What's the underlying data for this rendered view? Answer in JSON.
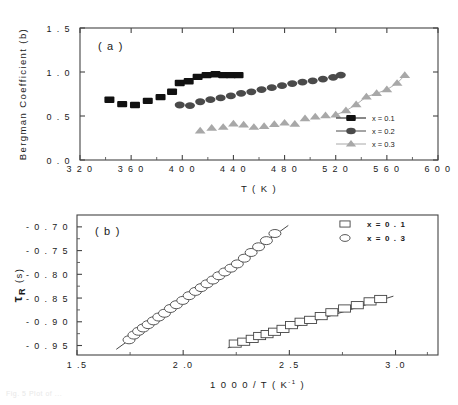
{
  "figure": {
    "caption_partial": "Fig. 5  Plot of ..."
  },
  "chart_data": [
    {
      "type": "scatter",
      "panel_label": "( a )",
      "title": "",
      "xlabel": "T ( K )",
      "ylabel": "Bergman Coefficient (b)",
      "xlim": [
        320,
        600
      ],
      "ylim": [
        0.0,
        1.5
      ],
      "xticks": [
        320,
        360,
        400,
        440,
        480,
        520,
        560,
        600
      ],
      "xticklabels": [
        "3 2 0",
        "3 6 0",
        "4 0 0",
        "4 4 0",
        "4 8 0",
        "5 2 0",
        "5 6 0",
        "6 0 0"
      ],
      "yticks": [
        0.0,
        0.5,
        1.0,
        1.5
      ],
      "yticklabels": [
        "0 . 0",
        "0 . 5",
        "1 . 0",
        "1 . 5"
      ],
      "grid": false,
      "legend_position": "lower-right",
      "series": [
        {
          "name": "x = 0.1",
          "marker": "square",
          "color": "#111111",
          "x": [
            343,
            353,
            363,
            373,
            383,
            392,
            398,
            405,
            412,
            419,
            426,
            432,
            438,
            444
          ],
          "y": [
            0.685,
            0.635,
            0.625,
            0.672,
            0.715,
            0.775,
            0.875,
            0.895,
            0.945,
            0.965,
            0.975,
            0.965,
            0.965,
            0.965
          ]
        },
        {
          "name": "x = 0.2",
          "marker": "circle",
          "color": "#4a4a4a",
          "x": [
            398,
            406,
            414,
            422,
            430,
            438,
            446,
            454,
            462,
            470,
            478,
            486,
            494,
            502,
            510,
            518,
            524
          ],
          "y": [
            0.625,
            0.618,
            0.662,
            0.685,
            0.705,
            0.728,
            0.758,
            0.775,
            0.8,
            0.822,
            0.845,
            0.868,
            0.885,
            0.9,
            0.92,
            0.94,
            0.965
          ]
        },
        {
          "name": "x = 0.3",
          "marker": "triangle",
          "color": "#a8a8a8",
          "x": [
            414,
            423,
            432,
            440,
            448,
            456,
            464,
            472,
            480,
            488,
            496,
            504,
            512,
            520,
            528,
            536,
            544,
            552,
            560,
            568,
            574
          ],
          "y": [
            0.33,
            0.362,
            0.372,
            0.41,
            0.4,
            0.372,
            0.382,
            0.405,
            0.42,
            0.408,
            0.47,
            0.49,
            0.505,
            0.512,
            0.56,
            0.63,
            0.718,
            0.758,
            0.8,
            0.872,
            0.962
          ]
        }
      ]
    },
    {
      "type": "scatter",
      "panel_label": "( b )",
      "title": "",
      "xlabel": "1 0 0 0 / T ( K⁻¹ )",
      "xlabel_main": "1 0 0 0 / T ( K",
      "xlabel_sup": "-1",
      "xlabel_tail": ")",
      "ylabel": "τR (s)",
      "ylabel_tau": "τ",
      "ylabel_sub": "R",
      "ylabel_unit": " (s)",
      "xlim": [
        1.5,
        3.2
      ],
      "ylim": [
        -0.97,
        -0.675
      ],
      "xticks": [
        1.5,
        2.0,
        2.5,
        3.0
      ],
      "xticklabels": [
        "1 .5",
        "2 .0",
        "2 .5",
        "3 .0"
      ],
      "yticks": [
        -0.7,
        -0.75,
        -0.8,
        -0.85,
        -0.9,
        -0.95
      ],
      "yticklabels": [
        "- 0 . 7 0",
        "- 0 . 7 5",
        "- 0 . 8 0",
        "- 0 . 8 5",
        "- 0 . 9 0",
        "- 0 . 9 5"
      ],
      "grid": false,
      "legend_position": "upper-right",
      "series": [
        {
          "name": "x = 0 . 1",
          "marker": "open-square",
          "color": "#444444",
          "fit_line": {
            "x": [
              2.21,
              2.99
            ],
            "y": [
              -0.955,
              -0.846
            ]
          },
          "x": [
            2.245,
            2.285,
            2.325,
            2.36,
            2.395,
            2.43,
            2.47,
            2.51,
            2.555,
            2.6,
            2.65,
            2.7,
            2.76,
            2.82,
            2.88,
            2.93
          ],
          "y": [
            -0.946,
            -0.942,
            -0.936,
            -0.93,
            -0.926,
            -0.921,
            -0.915,
            -0.907,
            -0.9,
            -0.896,
            -0.888,
            -0.88,
            -0.872,
            -0.865,
            -0.857,
            -0.852
          ]
        },
        {
          "name": "x = 0 . 3",
          "marker": "open-circle",
          "color": "#444444",
          "fit_line": {
            "x": [
              1.685,
              2.495
            ],
            "y": [
              -0.958,
              -0.697
            ]
          },
          "x": [
            1.745,
            1.768,
            1.79,
            1.812,
            1.835,
            1.86,
            1.885,
            1.912,
            1.94,
            1.968,
            1.998,
            2.028,
            2.058,
            2.085,
            2.112,
            2.14,
            2.168,
            2.196,
            2.225,
            2.255,
            2.288,
            2.32,
            2.355,
            2.392,
            2.432
          ],
          "y": [
            -0.938,
            -0.928,
            -0.92,
            -0.913,
            -0.906,
            -0.898,
            -0.89,
            -0.882,
            -0.872,
            -0.864,
            -0.855,
            -0.845,
            -0.836,
            -0.828,
            -0.82,
            -0.812,
            -0.803,
            -0.795,
            -0.787,
            -0.778,
            -0.766,
            -0.754,
            -0.742,
            -0.729,
            -0.714
          ]
        }
      ]
    }
  ]
}
